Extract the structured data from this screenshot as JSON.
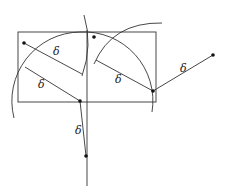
{
  "figure": {
    "colors": {
      "line": "#333333",
      "point": "#111111",
      "background": "#ffffff"
    },
    "rectangle": {
      "x": 18,
      "y": 32,
      "width": 138,
      "height": 70
    },
    "vertical_line": {
      "x": 87,
      "y1": 30,
      "y2": 186
    },
    "points": [
      {
        "id": "p1",
        "x": 24,
        "y": 43
      },
      {
        "id": "p2",
        "x": 94,
        "y": 37
      },
      {
        "id": "p3",
        "x": 80,
        "y": 101
      },
      {
        "id": "p4",
        "x": 153,
        "y": 91
      },
      {
        "id": "p5",
        "x": 213,
        "y": 55
      },
      {
        "id": "p6",
        "x": 86,
        "y": 156
      }
    ],
    "segments": [
      {
        "x1": 24,
        "y1": 43,
        "x2": 82,
        "y2": 74,
        "label": "δ",
        "lx": 53,
        "ly": 55
      },
      {
        "x1": 25,
        "y1": 67,
        "x2": 80,
        "y2": 101,
        "label": "δ",
        "lx": 38,
        "ly": 88
      },
      {
        "x1": 96,
        "y1": 60,
        "x2": 153,
        "y2": 91,
        "label": "δ",
        "lx": 115,
        "ly": 83
      },
      {
        "x1": 153,
        "y1": 91,
        "x2": 213,
        "y2": 55,
        "label": "δ",
        "lx": 180,
        "ly": 72
      },
      {
        "x1": 80,
        "y1": 101,
        "x2": 86,
        "y2": 156,
        "label": "δ",
        "lx": 75,
        "ly": 134
      }
    ],
    "labels": [
      "δ",
      "δ",
      "δ",
      "δ",
      "δ"
    ]
  }
}
